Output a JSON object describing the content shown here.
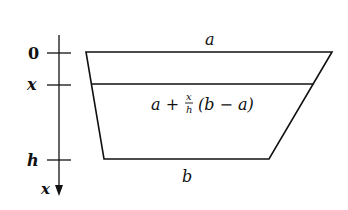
{
  "diagram": {
    "axis": {
      "direction_label": "x",
      "ticks": [
        {
          "label": "0",
          "y": 53
        },
        {
          "label": "x",
          "y": 85
        },
        {
          "label": "h",
          "y": 160
        }
      ]
    },
    "trapezoid": {
      "top_label": "a",
      "bottom_label": "b",
      "slice_formula": {
        "prefix": "a +",
        "frac_num": "x",
        "frac_den": "h",
        "suffix": "(b − a)"
      }
    },
    "colors": {
      "stroke": "#111111",
      "background": "#ffffff"
    }
  }
}
